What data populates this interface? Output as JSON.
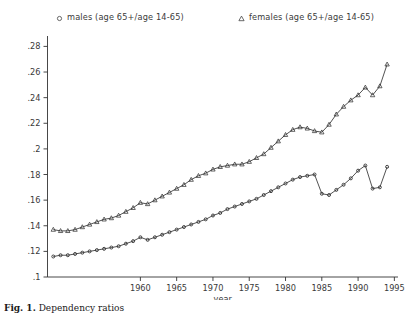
{
  "figure": {
    "caption_label": "Fig. 1.",
    "caption_text": "Dependency ratios",
    "background": "#ffffff",
    "line_color": "#333333",
    "marker_color": "#333333"
  },
  "legend": {
    "position": "top",
    "entries": [
      {
        "marker": "circle-marker",
        "label": "males (age 65+/age 14-65)"
      },
      {
        "marker": "triangle-marker",
        "label": "females (age 65+/age 14-65)"
      }
    ]
  },
  "chart_data": {
    "type": "line",
    "title": "",
    "subtitle": "",
    "xlabel": "year",
    "ylabel": "",
    "xlim": [
      1947.2,
      1995.5
    ],
    "ylim": [
      0.1,
      0.285
    ],
    "grid": false,
    "legend_position": "top",
    "xticks": [
      1960,
      1965,
      1970,
      1975,
      1980,
      1985,
      1990,
      1995
    ],
    "xtick_labels": [
      "1960",
      "1965",
      "1970",
      "1975",
      "1980",
      "1985",
      "1990",
      "1995"
    ],
    "yticks": [
      0.1,
      0.12,
      0.14,
      0.16,
      0.18,
      0.2,
      0.22,
      0.24,
      0.26,
      0.28
    ],
    "ytick_labels": [
      ".1",
      ".12",
      ".14",
      ".16",
      ".18",
      ".2",
      ".22",
      ".24",
      ".26",
      ".28"
    ],
    "x": [
      1948,
      1949,
      1950,
      1951,
      1952,
      1953,
      1954,
      1955,
      1956,
      1957,
      1958,
      1959,
      1960,
      1961,
      1962,
      1963,
      1964,
      1965,
      1966,
      1967,
      1968,
      1969,
      1970,
      1971,
      1972,
      1973,
      1974,
      1975,
      1976,
      1977,
      1978,
      1979,
      1980,
      1981,
      1982,
      1983,
      1984,
      1985,
      1986,
      1987,
      1988,
      1989,
      1990,
      1991,
      1992,
      1993,
      1994
    ],
    "series": [
      {
        "name": "males (age 65+/age 14-65)",
        "marker": "circle-marker",
        "values": [
          0.116,
          0.117,
          0.117,
          0.118,
          0.119,
          0.12,
          0.121,
          0.122,
          0.123,
          0.124,
          0.126,
          0.128,
          0.131,
          0.129,
          0.131,
          0.133,
          0.135,
          0.137,
          0.139,
          0.141,
          0.143,
          0.145,
          0.148,
          0.15,
          0.153,
          0.155,
          0.157,
          0.159,
          0.161,
          0.164,
          0.167,
          0.17,
          0.173,
          0.176,
          0.178,
          0.179,
          0.18,
          0.165,
          0.164,
          0.168,
          0.172,
          0.177,
          0.183,
          0.187,
          0.169,
          0.17,
          0.186
        ]
      },
      {
        "name": "females (age 65+/age 14-65)",
        "marker": "triangle-marker",
        "values": [
          0.137,
          0.136,
          0.136,
          0.137,
          0.139,
          0.141,
          0.143,
          0.145,
          0.146,
          0.148,
          0.151,
          0.154,
          0.158,
          0.157,
          0.16,
          0.163,
          0.166,
          0.169,
          0.172,
          0.176,
          0.179,
          0.181,
          0.184,
          0.186,
          0.187,
          0.188,
          0.188,
          0.19,
          0.193,
          0.196,
          0.201,
          0.206,
          0.211,
          0.215,
          0.217,
          0.216,
          0.214,
          0.213,
          0.219,
          0.227,
          0.233,
          0.238,
          0.242,
          0.248,
          0.242,
          0.249,
          0.266
        ]
      }
    ]
  }
}
